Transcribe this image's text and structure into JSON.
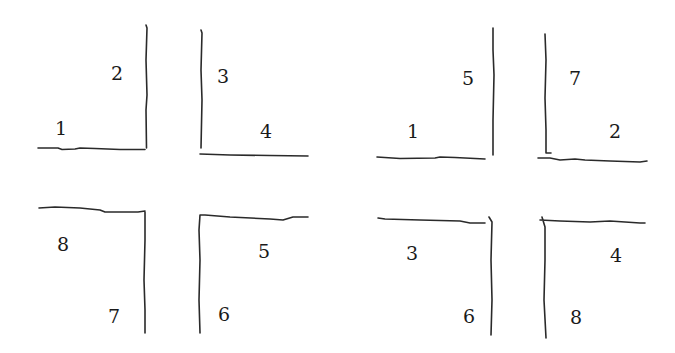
{
  "diagram": {
    "left_figure": {
      "top_left": {
        "bottom_label": "1",
        "side_label": "2"
      },
      "top_right": {
        "side_label": "3",
        "bottom_label": "4"
      },
      "bottom_left": {
        "top_label": "8",
        "side_label": "7"
      },
      "bottom_right": {
        "top_label": "5",
        "side_label": "6"
      }
    },
    "right_figure": {
      "top_left": {
        "bottom_label": "1",
        "side_label": "5"
      },
      "top_right": {
        "side_label": "7",
        "bottom_label": "2"
      },
      "bottom_left": {
        "top_label": "3",
        "side_label": "6"
      },
      "bottom_right": {
        "top_label": "4",
        "side_label": "8"
      }
    },
    "colors": {
      "ink": "#2a2a2a",
      "background": "#ffffff"
    }
  }
}
